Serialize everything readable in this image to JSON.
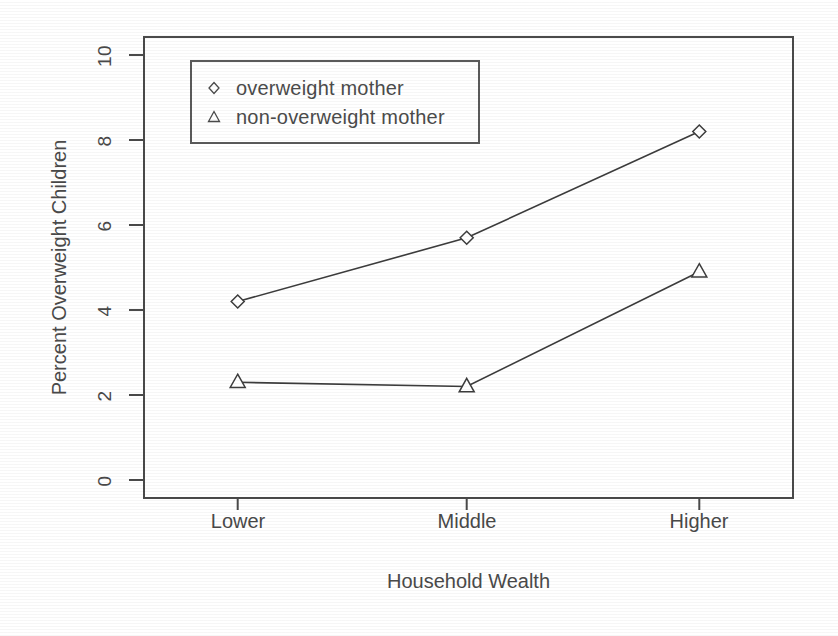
{
  "chart_data": {
    "type": "line",
    "title": "",
    "xlabel": "Household Wealth",
    "ylabel": "Percent Overweight Children",
    "categories": [
      "Lower",
      "Middle",
      "Higher"
    ],
    "series": [
      {
        "name": "overweight mother",
        "marker": "diamond",
        "values": [
          4.2,
          5.7,
          8.2
        ]
      },
      {
        "name": "non-overweight mother",
        "marker": "triangle",
        "values": [
          2.3,
          2.2,
          4.9
        ]
      }
    ],
    "ylim": [
      0,
      10
    ],
    "yticks": [
      0,
      2,
      4,
      6,
      8,
      10
    ],
    "ytick_labels": [
      "0",
      "2",
      "4",
      "6",
      "8",
      "10"
    ],
    "xtick_labels": [
      "Lower",
      "Middle",
      "Higher"
    ],
    "grid": false,
    "legend_position": "top-left",
    "line_color": "#3c3c3c",
    "axis_color": "#4a4a4a",
    "background": "#ffffff"
  },
  "legend": {
    "entries": [
      {
        "label": "overweight mother",
        "marker": "diamond-marker-icon"
      },
      {
        "label": "non-overweight mother",
        "marker": "triangle-marker-icon"
      }
    ]
  },
  "axes": {
    "y_title": "Percent Overweight Children",
    "x_title": "Household Wealth",
    "y_tick_labels": [
      "10",
      "8",
      "6",
      "4",
      "2",
      "0"
    ],
    "x_tick_labels": [
      "Lower",
      "Middle",
      "Higher"
    ]
  }
}
